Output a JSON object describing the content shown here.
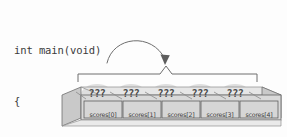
{
  "diagram": {
    "background_color": "#fdfdfd",
    "code": {
      "lines": [
        "int main(void)",
        "{",
        "int scores[5];",
        "…",
        "}"
      ],
      "line_0": "int main(void)",
      "line_1": "{",
      "line_2": "int scores[5];",
      "line_3": "…",
      "line_4": "}",
      "text_color": "#3b3b3b"
    },
    "annotation": {
      "arrow": "curved-arrow",
      "arrow_from": "int scores[5];",
      "arrow_to": "array-brace",
      "brace": "horizontal-brace-with-peak",
      "stroke_color": "#6e6e6e"
    },
    "array": {
      "element_count": 5,
      "value_placeholder": "???",
      "values": [
        "???",
        "???",
        "???",
        "???",
        "???"
      ],
      "labels": [
        "scores[0]",
        "scores[1]",
        "scores[2]",
        "scores[3]",
        "scores[4]"
      ],
      "cell_fill": "#d9d9d9",
      "cell_border": "#7a7a7a",
      "end_cap_fill": "#c9c9c9",
      "top_face_fill": "#e3e3e3",
      "blob_fill": "#dcdcdc"
    }
  }
}
